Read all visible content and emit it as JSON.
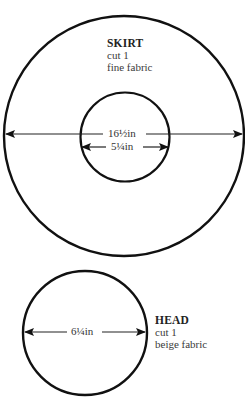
{
  "pieces": [
    {
      "name": "SKIRT",
      "cut": "cut 1",
      "fabric": "fine fabric",
      "measurements": {
        "outer_diameter": "16½in",
        "inner_diameter": "5¼in"
      }
    },
    {
      "name": "HEAD",
      "cut": "cut 1",
      "fabric": "beige fabric",
      "measurements": {
        "diameter": "6¼in"
      }
    }
  ],
  "colors": {
    "line": "#111111",
    "text": "#333333",
    "background": "#ffffff"
  }
}
